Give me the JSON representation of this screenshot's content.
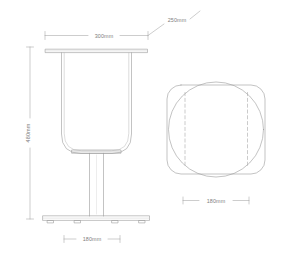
{
  "drawing": {
    "type": "technical-orthographic-drawing",
    "subject": "pedestal stool / side table",
    "background_color": "#ffffff",
    "line_color": "#9a9a9a",
    "hidden_line_color": "#a8a8a8",
    "text_color": "#7d7d7d",
    "units": "mm"
  },
  "views": {
    "elevation": {
      "name": "front elevation",
      "description": "U-shaped seat shell on central column with flat disc base and four feet"
    },
    "plan": {
      "name": "top plan",
      "description": "rounded square outline overlapped by circle with two dashed hidden edges"
    }
  },
  "dimensions": {
    "top_width": {
      "label": "300mm",
      "value": 300,
      "axis": "horizontal",
      "applies_to": "top plate width"
    },
    "depth_leader": {
      "label": "250mm",
      "value": 250,
      "axis": "leader",
      "applies_to": "top plate depth"
    },
    "overall_height": {
      "label": "480mm",
      "value": 480,
      "axis": "vertical",
      "applies_to": "overall height"
    },
    "base_width": {
      "label": "180mm",
      "value": 180,
      "axis": "horizontal",
      "applies_to": "base plate width"
    },
    "plan_width": {
      "label": "180mm",
      "value": 180,
      "axis": "horizontal",
      "applies_to": "plan view width"
    }
  }
}
